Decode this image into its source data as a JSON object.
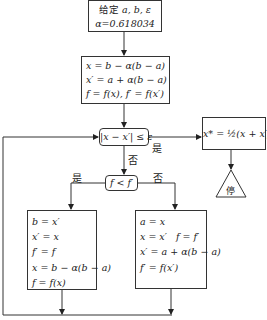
{
  "diagram": {
    "start": {
      "line1_cn": "给定",
      "line1_vars": "a, b, ε",
      "line2": "α=0.618034"
    },
    "init": {
      "lines": [
        "x = b − α(b − a)",
        "x′ = a + α(b − a)",
        "f = f(x), f′ = f(x′)"
      ]
    },
    "check": {
      "text": "|x − x′| ≤ ε"
    },
    "result": {
      "text": "x* = ½(x + x′)"
    },
    "stop": {
      "text": "停"
    },
    "compare": {
      "text": "f < f′"
    },
    "left_branch": {
      "lines": [
        "b = x′",
        "x′ = x",
        "f′ = f",
        "x = b − α(b − a)",
        "f = f(x)"
      ]
    },
    "right_branch": {
      "lines": [
        "a = x",
        "x = x′   f = f′",
        "x′ = a + α(b − a)",
        "f′ = f(x′)"
      ]
    },
    "labels": {
      "check_yes": "是",
      "check_no": "否",
      "compare_yes": "是",
      "compare_no": "否"
    }
  }
}
